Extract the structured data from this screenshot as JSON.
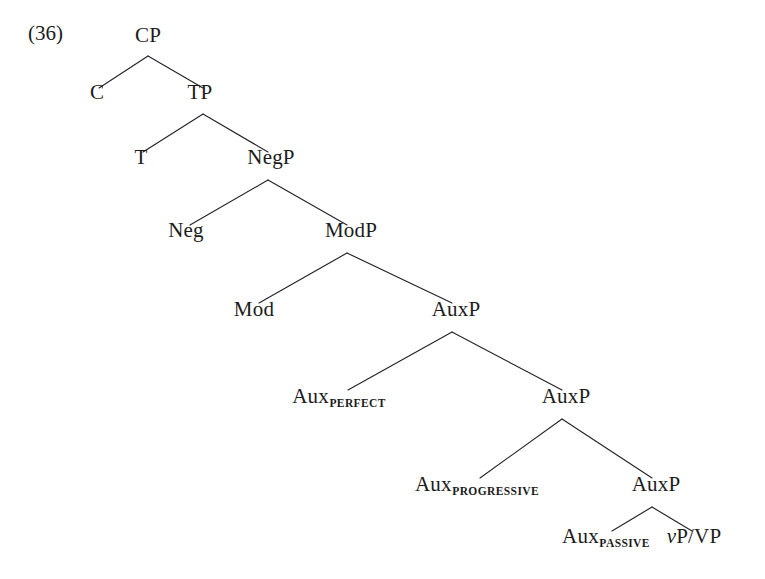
{
  "figure": {
    "example_number": "(36)",
    "top_artifact": "",
    "type": "syntax-tree",
    "root": "CP",
    "nodes": [
      {
        "id": "cp",
        "label": "CP",
        "sub": "",
        "x": 148,
        "y": 46
      },
      {
        "id": "c",
        "label": "C",
        "sub": "",
        "x": 97,
        "y": 103
      },
      {
        "id": "tp",
        "label": "TP",
        "sub": "",
        "x": 200,
        "y": 103
      },
      {
        "id": "t",
        "label": "T",
        "sub": "",
        "x": 141,
        "y": 168
      },
      {
        "id": "negp",
        "label": "NegP",
        "sub": "",
        "x": 271,
        "y": 168
      },
      {
        "id": "neg",
        "label": "Neg",
        "sub": "",
        "x": 186,
        "y": 241
      },
      {
        "id": "modp",
        "label": "ModP",
        "sub": "",
        "x": 351,
        "y": 241
      },
      {
        "id": "mod",
        "label": "Mod",
        "sub": "",
        "x": 254,
        "y": 320
      },
      {
        "id": "auxp-1",
        "label": "AuxP",
        "sub": "",
        "x": 456,
        "y": 320
      },
      {
        "id": "aux-perfect",
        "label": "Aux",
        "sub": "PERFECT",
        "x": 339,
        "y": 407
      },
      {
        "id": "auxp-2",
        "label": "AuxP",
        "sub": "",
        "x": 566,
        "y": 407
      },
      {
        "id": "aux-progressive",
        "label": "Aux",
        "sub": "PROGRESSIVE",
        "x": 477,
        "y": 495
      },
      {
        "id": "auxp-3",
        "label": "AuxP",
        "sub": "",
        "x": 656,
        "y": 495
      },
      {
        "id": "aux-passive",
        "label": "Aux",
        "sub": "PASSIVE",
        "x": 606,
        "y": 547
      },
      {
        "id": "vp-vp",
        "label": "P/VP",
        "sub": "",
        "italic_prefix": "v",
        "x": 694,
        "y": 547
      }
    ],
    "edges": [
      {
        "from": "cp",
        "to": "c",
        "x1": 148,
        "y1": 56,
        "x2": 99,
        "y2": 88
      },
      {
        "from": "cp",
        "to": "tp",
        "x1": 148,
        "y1": 56,
        "x2": 203,
        "y2": 88
      },
      {
        "from": "tp",
        "to": "t",
        "x1": 203,
        "y1": 114,
        "x2": 143,
        "y2": 152
      },
      {
        "from": "tp",
        "to": "negp",
        "x1": 203,
        "y1": 114,
        "x2": 268,
        "y2": 152
      },
      {
        "from": "negp",
        "to": "neg",
        "x1": 268,
        "y1": 180,
        "x2": 190,
        "y2": 225
      },
      {
        "from": "negp",
        "to": "modp",
        "x1": 268,
        "y1": 180,
        "x2": 347,
        "y2": 225
      },
      {
        "from": "modp",
        "to": "mod",
        "x1": 347,
        "y1": 253,
        "x2": 259,
        "y2": 303
      },
      {
        "from": "modp",
        "to": "auxp-1",
        "x1": 347,
        "y1": 253,
        "x2": 452,
        "y2": 303
      },
      {
        "from": "auxp-1",
        "to": "aux-perfect",
        "x1": 452,
        "y1": 332,
        "x2": 348,
        "y2": 390
      },
      {
        "from": "auxp-1",
        "to": "auxp-2",
        "x1": 452,
        "y1": 332,
        "x2": 562,
        "y2": 390
      },
      {
        "from": "auxp-2",
        "to": "aux-progressive",
        "x1": 562,
        "y1": 419,
        "x2": 480,
        "y2": 478
      },
      {
        "from": "auxp-2",
        "to": "auxp-3",
        "x1": 562,
        "y1": 419,
        "x2": 652,
        "y2": 478
      },
      {
        "from": "auxp-3",
        "to": "aux-passive",
        "x1": 652,
        "y1": 507,
        "x2": 612,
        "y2": 531
      },
      {
        "from": "auxp-3",
        "to": "vp-vp",
        "x1": 652,
        "y1": 507,
        "x2": 692,
        "y2": 531
      }
    ],
    "colors": {
      "background": "#ffffff",
      "text": "#1b1b1b",
      "branch": "#23232a"
    }
  }
}
